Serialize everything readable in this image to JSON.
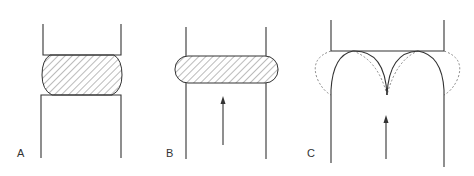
{
  "figure": {
    "panels": [
      {
        "label": "A",
        "description": "Hatched rounded blob compressed between upper and lower blocks"
      },
      {
        "label": "B",
        "description": "Flattened hatched blob between parallel walls with upward arrow"
      },
      {
        "label": "C",
        "description": "Double-arch solid profile with dotted outline under top block, upward arrow"
      }
    ]
  },
  "colors": {
    "line": "#333333",
    "dotted": "#888888",
    "hatch": "#555555",
    "background": "#ffffff"
  }
}
